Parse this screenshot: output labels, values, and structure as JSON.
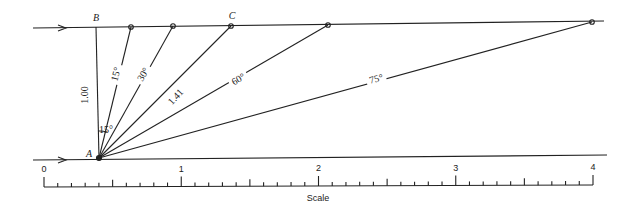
{
  "points": {
    "A": {
      "label": "A",
      "x": 99,
      "y": 158
    },
    "B": {
      "label": "B",
      "x": 96,
      "y": 27
    },
    "C": {
      "label": "C",
      "x": 231,
      "y": 26
    }
  },
  "top_line": {
    "x1": 33,
    "y1": 28,
    "x2": 604,
    "y2": 21
  },
  "bottom_line": {
    "x1": 33,
    "y1": 160,
    "x2": 607,
    "y2": 155
  },
  "vertical_label": "1.00",
  "rays": [
    {
      "angle": "15°",
      "end": [
        131,
        27
      ],
      "label_pos": [
        119,
        75
      ],
      "rot": -75
    },
    {
      "angle": "30°",
      "end": [
        173,
        26
      ],
      "label_pos": [
        146,
        76
      ],
      "rot": -60
    },
    {
      "angle": "45°",
      "end": [
        231,
        26
      ],
      "label": "1.41",
      "label_pos": [
        178,
        99
      ],
      "rot": -47
    },
    {
      "angle": "60°",
      "end": [
        328,
        25
      ],
      "label_pos": [
        240,
        82
      ],
      "rot": -30
    },
    {
      "angle": "75°",
      "end": [
        592,
        22
      ],
      "label_pos": [
        377,
        82
      ],
      "rot": -15
    }
  ],
  "angle_marker_label": "15°",
  "scale": {
    "title": "Scale",
    "x0": 44,
    "x4": 593,
    "y": 187,
    "major_labels": [
      "0",
      "1",
      "2",
      "3",
      "4"
    ]
  }
}
